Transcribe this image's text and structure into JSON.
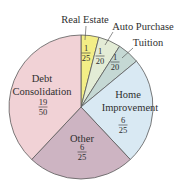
{
  "chart_data": {
    "type": "pie",
    "title": "",
    "start_angle_deg": 0,
    "direction": "clockwise",
    "slices": [
      {
        "label": "Real Estate",
        "fraction": "1/25",
        "num": "1",
        "den": "25",
        "value": 0.04,
        "color": "#f3ee86"
      },
      {
        "label": "Auto Purchase",
        "fraction": "1/20",
        "num": "1",
        "den": "20",
        "value": 0.05,
        "color": "#e3ecd6"
      },
      {
        "label": "Tuition",
        "fraction": "1/20",
        "num": "1",
        "den": "20",
        "value": 0.05,
        "color": "#c5d8d4"
      },
      {
        "label": "Home Improvement",
        "label_lines": [
          "Home",
          "Improvement"
        ],
        "fraction": "6/25",
        "num": "6",
        "den": "25",
        "value": 0.24,
        "color": "#d9e9f3"
      },
      {
        "label": "Other",
        "label_lines": [
          "Other"
        ],
        "fraction": "6/25",
        "num": "6",
        "den": "25",
        "value": 0.24,
        "color": "#cdb4c2"
      },
      {
        "label": "Debt Consolidation",
        "label_lines": [
          "Debt",
          "Consolidation"
        ],
        "fraction": "19/50",
        "num": "19",
        "den": "50",
        "value": 0.38,
        "color": "#f1d2d6"
      }
    ]
  }
}
